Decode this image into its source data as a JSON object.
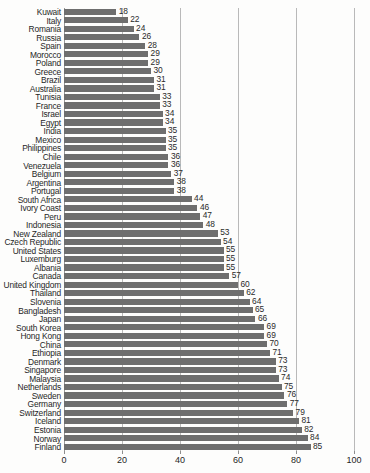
{
  "chart_data": {
    "type": "bar",
    "orientation": "horizontal",
    "title": "",
    "xlabel": "",
    "ylabel": "",
    "xlim": [
      0,
      100
    ],
    "grid": true,
    "gridlines": [
      0,
      20,
      40,
      60,
      80,
      100
    ],
    "legend": "none",
    "bar_color": "#6e6e6e",
    "sorted": "ascending",
    "tick_labels": [
      "0",
      "20",
      "40",
      "60",
      "80",
      "100"
    ],
    "categories": [
      "Kuwait",
      "Italy",
      "Romania",
      "Russia",
      "Spain",
      "Morocco",
      "Poland",
      "Greece",
      "Brazil",
      "Australia",
      "Tunisia",
      "France",
      "Israel",
      "Egypt",
      "India",
      "Mexico",
      "Philippines",
      "Chile",
      "Venezuela",
      "Belgium",
      "Argentina",
      "Portugal",
      "South Africa",
      "Ivory Coast",
      "Peru",
      "Indonesia",
      "New Zealand",
      "Czech Republic",
      "United States",
      "Luxemburg",
      "Albania",
      "Canada",
      "United Kingdom",
      "Thailand",
      "Slovenia",
      "Bangladesh",
      "Japan",
      "South Korea",
      "Hong Kong",
      "China",
      "Ethiopia",
      "Denmark",
      "Singapore",
      "Malaysia",
      "Netherlands",
      "Sweden",
      "Germany",
      "Switzerland",
      "Iceland",
      "Estonia",
      "Norway",
      "Finland"
    ],
    "values": [
      18,
      22,
      24,
      26,
      28,
      29,
      29,
      30,
      31,
      31,
      33,
      33,
      34,
      34,
      35,
      35,
      35,
      36,
      36,
      37,
      38,
      38,
      44,
      46,
      47,
      48,
      53,
      54,
      55,
      55,
      55,
      57,
      60,
      62,
      64,
      65,
      66,
      69,
      69,
      70,
      71,
      73,
      73,
      74,
      75,
      76,
      77,
      79,
      81,
      82,
      84,
      85
    ]
  }
}
